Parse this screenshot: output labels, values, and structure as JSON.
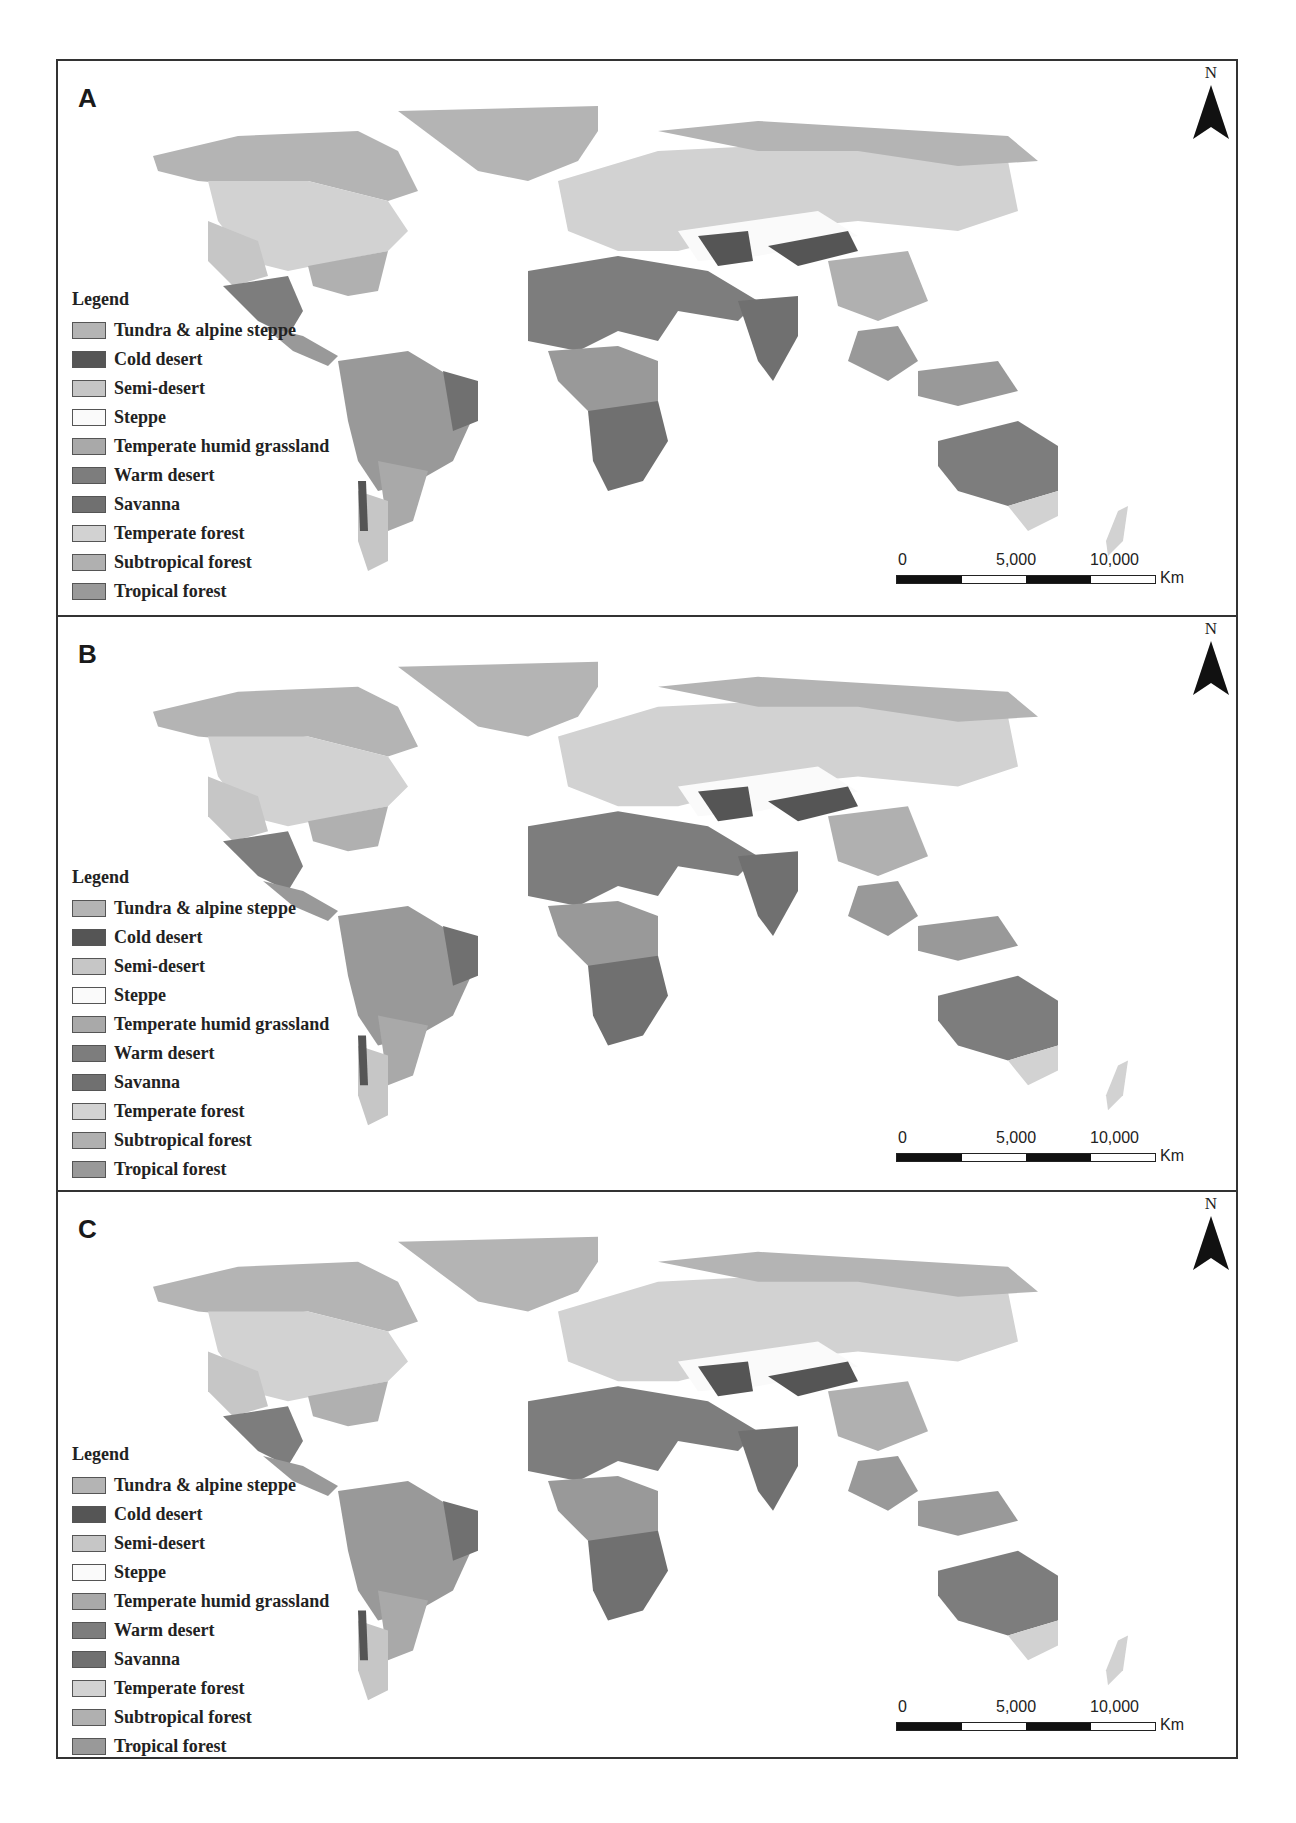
{
  "figure": {
    "panels": [
      {
        "id": "A",
        "label": "A"
      },
      {
        "id": "B",
        "label": "B"
      },
      {
        "id": "C",
        "label": "C"
      }
    ],
    "north_arrow": {
      "label": "N"
    },
    "legend": {
      "title": "Legend",
      "items": [
        {
          "label": "Tundra & alpine steppe",
          "color": "#b4b4b4"
        },
        {
          "label": "Cold desert",
          "color": "#555555"
        },
        {
          "label": "Semi-desert",
          "color": "#c6c6c6"
        },
        {
          "label": "Steppe",
          "color": "#fafafa"
        },
        {
          "label": "Temperate humid grassland",
          "color": "#a9a9a9"
        },
        {
          "label": "Warm desert",
          "color": "#7d7d7d"
        },
        {
          "label": "Savanna",
          "color": "#707070"
        },
        {
          "label": "Temperate forest",
          "color": "#d2d2d2"
        },
        {
          "label": "Subtropical forest",
          "color": "#b0b0b0"
        },
        {
          "label": "Tropical forest",
          "color": "#999999"
        }
      ]
    },
    "scale_bar": {
      "ticks": [
        "0",
        "5,000",
        "10,000"
      ],
      "unit": "Km"
    }
  }
}
